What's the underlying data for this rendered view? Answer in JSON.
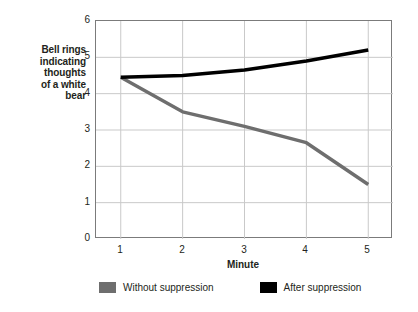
{
  "chart_data": {
    "type": "line",
    "title": "",
    "xlabel": "Minute",
    "ylabel": "Bell rings indicating thoughts of a white bear",
    "ylabel_lines": [
      "Bell rings",
      "indicating",
      "thoughts",
      "of a white",
      "bear"
    ],
    "x": [
      1,
      2,
      3,
      4,
      5
    ],
    "xlim": [
      0.6,
      5.4
    ],
    "ylim": [
      0,
      6
    ],
    "x_ticks": [
      "1",
      "2",
      "3",
      "4",
      "5"
    ],
    "y_ticks": [
      "0",
      "1",
      "2",
      "3",
      "4",
      "5",
      "6"
    ],
    "grid": true,
    "legend_position": "bottom",
    "series": [
      {
        "name": "Without suppression",
        "color": "#6e6e6e",
        "values": [
          4.45,
          3.5,
          3.1,
          2.65,
          1.5
        ]
      },
      {
        "name": "After suppression",
        "color": "#000000",
        "values": [
          4.45,
          4.5,
          4.65,
          4.9,
          5.2
        ]
      }
    ]
  },
  "axes": {
    "y_title_lines": [
      "Bell rings",
      "indicating",
      "thoughts",
      "of a white",
      "bear"
    ],
    "x_title": "Minute",
    "y_ticks": [
      "6",
      "5",
      "4",
      "3",
      "2",
      "1",
      "0"
    ],
    "x_ticks": [
      "1",
      "2",
      "3",
      "4",
      "5"
    ]
  },
  "legend": {
    "items": [
      {
        "label": "Without suppression",
        "color": "#6e6e6e"
      },
      {
        "label": "After suppression",
        "color": "#000000"
      }
    ]
  },
  "colors": {
    "without_suppression": "#6e6e6e",
    "after_suppression": "#000000",
    "grid": "#c9c9c9",
    "frame": "#7b7b7b",
    "text": "#231f20",
    "background": "#ffffff"
  }
}
